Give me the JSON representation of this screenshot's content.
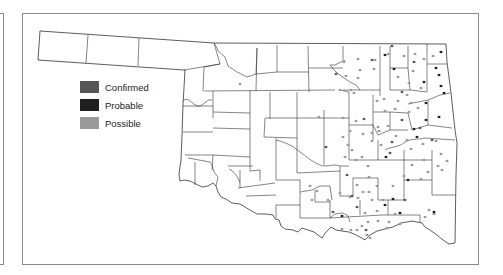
{
  "legend": {
    "items": [
      {
        "label": "Confirmed",
        "color": "#575757"
      },
      {
        "label": "Probable",
        "color": "#1e1e1e"
      },
      {
        "label": "Possible",
        "color": "#9a9a9a"
      }
    ]
  },
  "map": {
    "region": "Oklahoma counties",
    "border_color": "#333333",
    "frame_color": "#8a8a8a"
  },
  "markers": {
    "confirmed": [
      [
        336,
        74
      ],
      [
        372,
        60
      ],
      [
        392,
        46
      ],
      [
        414,
        62
      ],
      [
        402,
        92
      ],
      [
        364,
        119
      ],
      [
        402,
        120
      ],
      [
        432,
        140
      ],
      [
        420,
        128
      ],
      [
        390,
        153
      ],
      [
        352,
        196
      ],
      [
        357,
        207
      ],
      [
        405,
        200
      ],
      [
        366,
        230
      ],
      [
        347,
        175
      ],
      [
        392,
        142
      ],
      [
        326,
        147
      ],
      [
        333,
        212
      ]
    ],
    "probable": [
      [
        394,
        69
      ],
      [
        385,
        55
      ],
      [
        441,
        52
      ],
      [
        439,
        75
      ],
      [
        441,
        86
      ],
      [
        426,
        103
      ],
      [
        439,
        117
      ],
      [
        444,
        93
      ],
      [
        426,
        120
      ],
      [
        414,
        129
      ],
      [
        386,
        157
      ],
      [
        408,
        180
      ],
      [
        393,
        199
      ],
      [
        400,
        213
      ],
      [
        342,
        216
      ],
      [
        385,
        205
      ],
      [
        434,
        212
      ],
      [
        417,
        137
      ],
      [
        424,
        82
      ],
      [
        436,
        68
      ]
    ],
    "possible": [
      [
        344,
        62
      ],
      [
        358,
        59
      ],
      [
        375,
        60
      ],
      [
        360,
        70
      ],
      [
        374,
        69
      ],
      [
        346,
        76
      ],
      [
        358,
        78
      ],
      [
        340,
        90
      ],
      [
        388,
        54
      ],
      [
        404,
        56
      ],
      [
        415,
        54
      ],
      [
        424,
        59
      ],
      [
        398,
        77
      ],
      [
        409,
        83
      ],
      [
        421,
        88
      ],
      [
        413,
        71
      ],
      [
        433,
        56
      ],
      [
        407,
        95
      ],
      [
        398,
        101
      ],
      [
        411,
        103
      ],
      [
        418,
        108
      ],
      [
        395,
        109
      ],
      [
        409,
        112
      ],
      [
        385,
        111
      ],
      [
        378,
        127
      ],
      [
        372,
        133
      ],
      [
        356,
        121
      ],
      [
        363,
        134
      ],
      [
        350,
        131
      ],
      [
        343,
        137
      ],
      [
        352,
        150
      ],
      [
        356,
        160
      ],
      [
        345,
        157
      ],
      [
        348,
        145
      ],
      [
        362,
        157
      ],
      [
        368,
        166
      ],
      [
        372,
        141
      ],
      [
        381,
        145
      ],
      [
        396,
        136
      ],
      [
        407,
        140
      ],
      [
        411,
        149
      ],
      [
        423,
        144
      ],
      [
        436,
        141
      ],
      [
        441,
        154
      ],
      [
        424,
        160
      ],
      [
        438,
        166
      ],
      [
        447,
        161
      ],
      [
        428,
        172
      ],
      [
        442,
        170
      ],
      [
        412,
        165
      ],
      [
        404,
        176
      ],
      [
        421,
        179
      ],
      [
        369,
        177
      ],
      [
        357,
        185
      ],
      [
        363,
        192
      ],
      [
        358,
        198
      ],
      [
        369,
        192
      ],
      [
        377,
        186
      ],
      [
        372,
        200
      ],
      [
        383,
        200
      ],
      [
        377,
        211
      ],
      [
        365,
        213
      ],
      [
        368,
        222
      ],
      [
        378,
        221
      ],
      [
        389,
        222
      ],
      [
        400,
        224
      ],
      [
        393,
        186
      ],
      [
        350,
        197
      ],
      [
        340,
        193
      ],
      [
        328,
        200
      ],
      [
        310,
        186
      ],
      [
        317,
        191
      ],
      [
        312,
        200
      ],
      [
        357,
        230
      ],
      [
        362,
        226
      ],
      [
        367,
        235
      ],
      [
        370,
        238
      ],
      [
        387,
        228
      ],
      [
        395,
        214
      ],
      [
        434,
        214
      ],
      [
        425,
        217
      ],
      [
        429,
        210
      ],
      [
        351,
        90
      ],
      [
        354,
        93
      ],
      [
        240,
        84
      ],
      [
        319,
        117
      ],
      [
        343,
        118
      ],
      [
        377,
        101
      ],
      [
        384,
        99
      ],
      [
        379,
        131
      ],
      [
        388,
        126
      ],
      [
        351,
        230
      ],
      [
        342,
        229
      ]
    ]
  }
}
